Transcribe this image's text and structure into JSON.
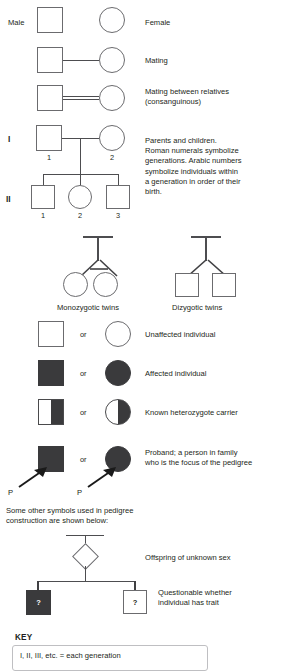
{
  "rows": {
    "male_female": {
      "male_label": "Male",
      "female_label": "Female"
    },
    "mating": {
      "label": "Mating"
    },
    "consanguineous": {
      "label": "Mating between relatives\n(consanguinous)"
    },
    "parents_children": {
      "gen1": "I",
      "gen2": "II",
      "gen1_numbers": [
        "1",
        "2"
      ],
      "gen2_numbers": [
        "1",
        "2",
        "3"
      ],
      "description": "Parents and children.\nRoman numerals symbolize\ngenerations. Arabic numbers\nsymbolize individuals within\na generation in order of their\nbirth."
    },
    "twins": {
      "monozygotic_label": "Monozygotic twins",
      "dizygotic_label": "Dizygotic twins"
    },
    "unaffected": {
      "or": "or",
      "label": "Unaffected individual"
    },
    "affected": {
      "or": "or",
      "label": "Affected individual"
    },
    "carrier": {
      "or": "or",
      "label": "Known heterozygote carrier"
    },
    "proband": {
      "or": "or",
      "label": "Proband; a person in family\nwho is the focus of the pedigree",
      "marker_left": "P",
      "marker_right": "P"
    },
    "other_symbols_note": "Some other symbols used in pedigree\nconstruction are shown below:",
    "unknown_sex": {
      "label": "Offspring of unknown sex"
    },
    "questionable": {
      "label": "Questionable whether\nindividual has trait",
      "mark_filled": "?",
      "mark_open": "?"
    }
  },
  "key": {
    "title": "KEY",
    "lines": [
      "I, II, III, etc. = each generation"
    ]
  },
  "colors": {
    "fill": "#3a3a3c",
    "outline": "#6b6b6e",
    "line": "#4d4d50",
    "text": "#231f20",
    "background": "#ffffff"
  }
}
